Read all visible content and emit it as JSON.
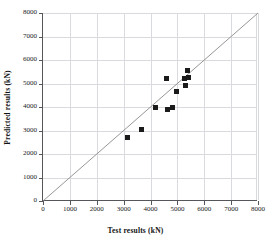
{
  "chart_data": {
    "type": "scatter",
    "title": "",
    "xlabel": "Test results (kN)",
    "ylabel": "Predicted results (kN)",
    "xlim": [
      0,
      8000
    ],
    "ylim": [
      0,
      8000
    ],
    "xticks": [
      0,
      1000,
      2000,
      3000,
      4000,
      5000,
      6000,
      7000,
      8000
    ],
    "yticks": [
      0,
      1000,
      2000,
      3000,
      4000,
      5000,
      6000,
      7000,
      8000
    ],
    "xtick_labels": [
      "0",
      "1000",
      "2000",
      "3000",
      "4000",
      "5000",
      "6000",
      "7000",
      "8000"
    ],
    "ytick_labels": [
      "0",
      "1000",
      "2000",
      "3000",
      "4000",
      "5000",
      "6000",
      "7000",
      "8000"
    ],
    "grid": true,
    "legend": "none",
    "marker": "square",
    "marker_color": "#1b1b1b",
    "reference_line": {
      "name": "1:1 line",
      "from": [
        0,
        0
      ],
      "to": [
        8000,
        8000
      ],
      "color": "#8a8a8a"
    },
    "points": [
      {
        "x": 3150,
        "y": 2720
      },
      {
        "x": 3650,
        "y": 3050
      },
      {
        "x": 4200,
        "y": 3960
      },
      {
        "x": 4600,
        "y": 5200
      },
      {
        "x": 4620,
        "y": 3900
      },
      {
        "x": 4800,
        "y": 3990
      },
      {
        "x": 4950,
        "y": 4680
      },
      {
        "x": 5250,
        "y": 5230
      },
      {
        "x": 5300,
        "y": 4920
      },
      {
        "x": 5380,
        "y": 5540
      },
      {
        "x": 5400,
        "y": 5250
      }
    ]
  }
}
